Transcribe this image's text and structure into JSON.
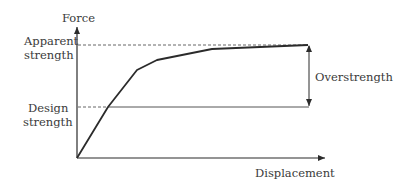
{
  "diagram": {
    "type": "force-displacement pushover curve",
    "axes": {
      "y_label": "Force",
      "x_label": "Displacement"
    },
    "levels": {
      "apparent_strength": {
        "line1": "Apparent",
        "line2": "strength"
      },
      "design_strength": {
        "line1": "Design",
        "line2": "strength"
      }
    },
    "annotation": {
      "overstrength": "Overstrength"
    },
    "curve_points_px": [
      [
        77,
        158
      ],
      [
        108,
        107
      ],
      [
        137,
        70
      ],
      [
        157,
        60
      ],
      [
        212,
        49
      ],
      [
        308,
        45
      ]
    ],
    "colors": {
      "line": "#2b2b2b",
      "text": "#3a3a3a",
      "background": "#ffffff"
    }
  }
}
